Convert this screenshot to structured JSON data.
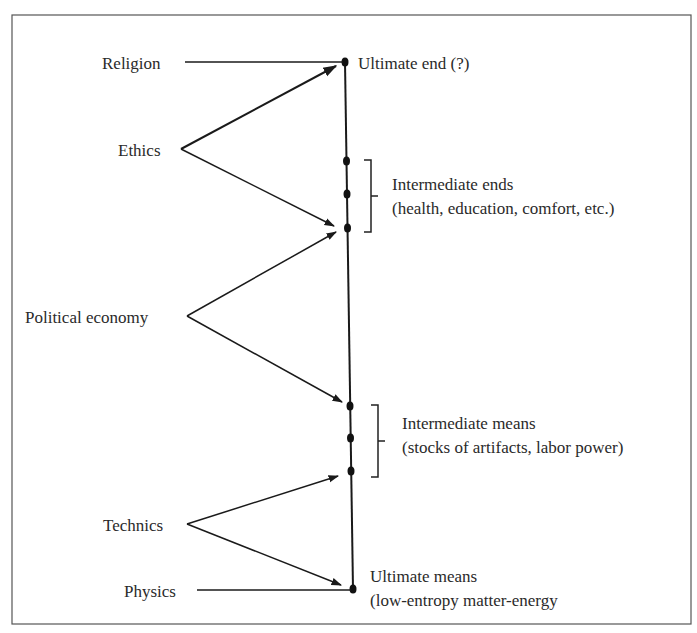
{
  "diagram": {
    "type": "ends-means spectrum",
    "left_labels": {
      "religion": "Religion",
      "ethics": "Ethics",
      "political_economy": "Political economy",
      "technics": "Technics",
      "physics": "Physics"
    },
    "right_labels": {
      "ultimate_end": "Ultimate end (?)",
      "intermediate_ends_title": "Intermediate ends",
      "intermediate_ends_detail": "(health, education, comfort, etc.)",
      "intermediate_means_title": "Intermediate means",
      "intermediate_means_detail": "(stocks of artifacts, labor power)",
      "ultimate_means_title": "Ultimate means",
      "ultimate_means_detail": "(low-entropy matter-energy"
    },
    "spectrum_points": [
      {
        "id": "ultimate-end",
        "y": 62
      },
      {
        "id": "intermediate-end-1",
        "y": 161
      },
      {
        "id": "intermediate-end-2",
        "y": 194
      },
      {
        "id": "intermediate-end-3",
        "y": 228
      },
      {
        "id": "intermediate-mean-1",
        "y": 406
      },
      {
        "id": "intermediate-mean-2",
        "y": 438
      },
      {
        "id": "intermediate-mean-3",
        "y": 471
      },
      {
        "id": "ultimate-means",
        "y": 589
      }
    ],
    "colors": {
      "ink": "#1a1a1a",
      "frame": "#555555",
      "background": "#ffffff"
    }
  }
}
